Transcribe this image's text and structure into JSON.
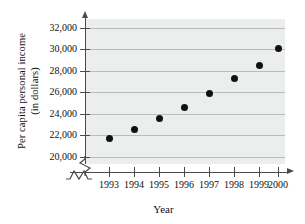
{
  "chart_data": {
    "type": "scatter",
    "title": "",
    "xlabel": "Year",
    "ylabel_lines": [
      "Per capita personal income",
      "(in dollars)"
    ],
    "ylabel": "Per capita personal income (in dollars)",
    "categories": [
      "1993",
      "1994",
      "1995",
      "1996",
      "1997",
      "1998",
      "1999",
      "2000"
    ],
    "x": [
      1993,
      1994,
      1995,
      1996,
      1997,
      1998,
      1999,
      2000
    ],
    "values": [
      21700,
      22550,
      23550,
      24650,
      25900,
      27300,
      28500,
      30050
    ],
    "ytick_labels": [
      "20,000",
      "22,000",
      "24,000",
      "26,000",
      "28,000",
      "30,000",
      "32,000"
    ],
    "ytick_values": [
      20000,
      22000,
      24000,
      26000,
      28000,
      30000,
      32000
    ],
    "ylim": [
      20000,
      32000
    ],
    "xlim": [
      1993,
      2000
    ],
    "grid": true,
    "legend": "none",
    "axis_break": {
      "y_axis": true,
      "x_axis": true,
      "note": "zigzag break marks near origin on both axes"
    },
    "colors": {
      "point": "#111111",
      "plot_background": "#eceded",
      "gridline": "#b9bcbd",
      "axis": "#4a4a4a",
      "text": "#111111",
      "page_background": "#ffffff"
    }
  }
}
